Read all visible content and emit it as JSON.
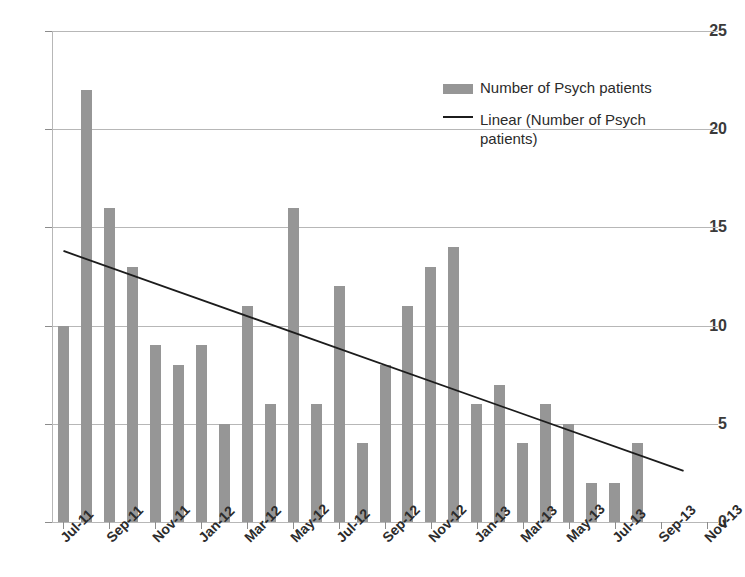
{
  "chart_data": {
    "type": "bar",
    "title": "",
    "xlabel": "",
    "ylabel": "",
    "ylim": [
      0,
      25
    ],
    "yticks": [
      0,
      5,
      10,
      15,
      20,
      25
    ],
    "grid": true,
    "legend_position": "upper-right",
    "categories": [
      "Jul-11",
      "Aug-11",
      "Sep-11",
      "Oct-11",
      "Nov-11",
      "Dec-11",
      "Jan-12",
      "Feb-12",
      "Mar-12",
      "Apr-12",
      "May-12",
      "Jun-12",
      "Jul-12",
      "Aug-12",
      "Sep-12",
      "Oct-12",
      "Nov-12",
      "Dec-12",
      "Jan-13",
      "Feb-13",
      "Mar-13",
      "Apr-13",
      "May-13",
      "Jun-13",
      "Jul-13",
      "Aug-13",
      "Sep-13"
    ],
    "axis_categories": [
      "Jul-11",
      "Aug-11",
      "Sep-11",
      "Oct-11",
      "Nov-11",
      "Dec-11",
      "Jan-12",
      "Feb-12",
      "Mar-12",
      "Apr-12",
      "May-12",
      "Jun-12",
      "Jul-12",
      "Aug-12",
      "Sep-12",
      "Oct-12",
      "Nov-12",
      "Dec-12",
      "Jan-13",
      "Feb-13",
      "Mar-13",
      "Apr-13",
      "May-13",
      "Jun-13",
      "Jul-13",
      "Aug-13",
      "Sep-13",
      "Oct-13",
      "Nov-13"
    ],
    "xtick_labels": [
      "Jul-11",
      "Sep-11",
      "Nov-11",
      "Jan-12",
      "Mar-12",
      "May-12",
      "Jul-12",
      "Sep-12",
      "Nov-12",
      "Jan-13",
      "Mar-13",
      "May-13",
      "Jul-13",
      "Sep-13",
      "Nov-13"
    ],
    "series": [
      {
        "name": "Number of Psych patients",
        "type": "bar",
        "color": "#969696",
        "values": [
          10,
          22,
          16,
          13,
          9,
          8,
          9,
          5,
          11,
          6,
          16,
          6,
          12,
          4,
          8,
          11,
          13,
          14,
          6,
          7,
          4,
          6,
          5,
          2,
          2,
          4,
          0
        ]
      },
      {
        "name": "Linear (Number of Psych patients)",
        "type": "line",
        "color": "#1c1c1c",
        "trend_start_value": 13.8,
        "trend_end_value": 2.6,
        "trend_start_category": "Jul-11",
        "trend_end_category": "Oct-13"
      }
    ]
  },
  "legend": {
    "entries": [
      {
        "label": "Number of Psych patients",
        "marker": "bar-swatch"
      },
      {
        "label": "Linear (Number of Psych patients)",
        "marker": "line-swatch"
      }
    ]
  }
}
